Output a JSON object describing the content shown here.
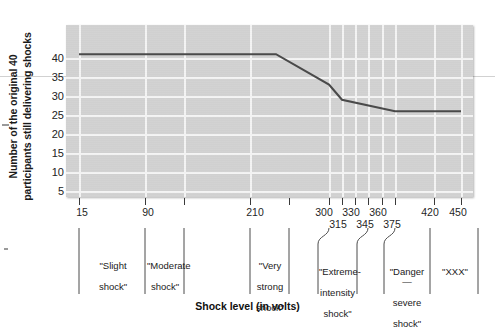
{
  "chart_data": {
    "type": "line",
    "title": "",
    "xlabel": "Shock level (in volts)",
    "ylabel_line1": "Number of the original 40",
    "ylabel_line2": "participants still delivering shocks",
    "ylim": [
      0,
      42
    ],
    "yticks": [
      5,
      10,
      15,
      20,
      25,
      30,
      35,
      40
    ],
    "xlim": [
      0,
      465
    ],
    "xtick_values": [
      15,
      90,
      135,
      210,
      300,
      315,
      330,
      345,
      360,
      375,
      420,
      450
    ],
    "xtick_labels": [
      "15",
      "90",
      "210",
      "300",
      "315",
      "330",
      "345",
      "360",
      "375",
      "420",
      "450"
    ],
    "grid": true,
    "legend": "none",
    "x": [
      15,
      240,
      300,
      315,
      375,
      450
    ],
    "values": [
      41,
      41,
      33,
      29,
      26,
      26
    ],
    "series": [
      {
        "name": "Participants still delivering shocks",
        "x": [
          15,
          240,
          300,
          315,
          375,
          450
        ],
        "values": [
          41,
          41,
          33,
          29,
          26,
          26
        ]
      }
    ],
    "categories": [
      {
        "label": "\"Slight\nshock\"",
        "center": 52,
        "span": [
          15,
          90
        ]
      },
      {
        "label": "\"Moderate\nshock\"",
        "center": 112,
        "span": [
          90,
          135
        ]
      },
      {
        "label": "\"Very\nstrong\nshock\"",
        "center": 232,
        "span": [
          210,
          255
        ]
      },
      {
        "label": "\"Extreme-\nintensity\nshock\"",
        "center": 322,
        "span": [
          300,
          345
        ]
      },
      {
        "label": "\"Danger—\nsevere\nshock\"",
        "center": 367,
        "span": [
          345,
          390
        ]
      },
      {
        "label": "\"XXX\"",
        "center": 432,
        "span": [
          420,
          450
        ]
      }
    ]
  },
  "y_axis": {
    "title_line1": "Number of the original 40",
    "title_line2": "participants still delivering shocks",
    "ticks": [
      "40",
      "35",
      "30",
      "25",
      "20",
      "15",
      "10",
      "5"
    ]
  },
  "x_axis": {
    "title": "Shock level (in volts)",
    "tick_labels_row1": [
      "15",
      "90",
      "210",
      "300",
      "330",
      "360",
      "420",
      "450"
    ],
    "tick_labels_row2": [
      "315",
      "345",
      "375"
    ]
  },
  "group_labels": [
    {
      "line1": "\"Slight",
      "line2": "shock\"",
      "line3": ""
    },
    {
      "line1": "\"Moderate",
      "line2": "shock\"",
      "line3": ""
    },
    {
      "line1": "\"Very",
      "line2": "strong",
      "line3": "shock\""
    },
    {
      "line1": "\"Extreme-",
      "line2": "intensity",
      "line3": "shock\""
    },
    {
      "line1": "\"Danger—",
      "line2": "severe",
      "line3": "shock\""
    },
    {
      "line1": "\"XXX\"",
      "line2": "",
      "line3": ""
    }
  ],
  "colors": {
    "plot_background": "#d2d2d2",
    "gridline": "#f4f4f4",
    "data_line": "#4a4a4a",
    "text": "#1a1a1a",
    "tick_mark": "#3a3a3a"
  }
}
